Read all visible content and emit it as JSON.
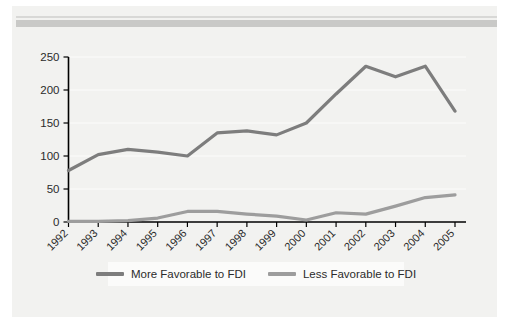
{
  "figure": {
    "background_color": "#ffffff",
    "plate_color": "#f2f2f0",
    "rule_thin_color": "#d8d8d6",
    "rule_thick_color": "#c9c9c7"
  },
  "legend": {
    "position": "bottom-center",
    "background_color": "#fbfbfa",
    "entries": [
      {
        "label": "More Favorable to FDI",
        "color": "#7d7d7d"
      },
      {
        "label": "Less Favorable to FDI",
        "color": "#9d9d9d"
      }
    ]
  },
  "axes": {
    "y_ticks": [
      "250",
      "200",
      "150",
      "100",
      "50",
      "0"
    ],
    "x_ticks": [
      "1992",
      "1993",
      "1994",
      "1995",
      "1996",
      "1997",
      "1998",
      "1999",
      "2000",
      "2001",
      "2002",
      "2003",
      "2004",
      "2005"
    ],
    "x_tick_rotation_deg": -45,
    "axis_color": "#000000",
    "gridline_color": "#ffffff"
  },
  "chart_data": {
    "type": "line",
    "title": "",
    "subtitle": "",
    "xlabel": "",
    "ylabel": "",
    "xlim": [
      "1992",
      "2005"
    ],
    "ylim": [
      0,
      250
    ],
    "ytick_interval": 50,
    "grid": true,
    "legend_position": "bottom-center",
    "categories": [
      "1992",
      "1993",
      "1994",
      "1995",
      "1996",
      "1997",
      "1998",
      "1999",
      "2000",
      "2001",
      "2002",
      "2003",
      "2004",
      "2005"
    ],
    "series": [
      {
        "name": "More Favorable to FDI",
        "color": "#7d7d7d",
        "values": [
          78,
          102,
          110,
          106,
          100,
          135,
          138,
          132,
          150,
          194,
          236,
          220,
          236,
          168
        ]
      },
      {
        "name": "Less Favorable to FDI",
        "color": "#9d9d9d",
        "values": [
          1,
          1,
          2,
          6,
          16,
          16,
          12,
          9,
          3,
          14,
          12,
          24,
          37,
          41
        ]
      }
    ]
  }
}
